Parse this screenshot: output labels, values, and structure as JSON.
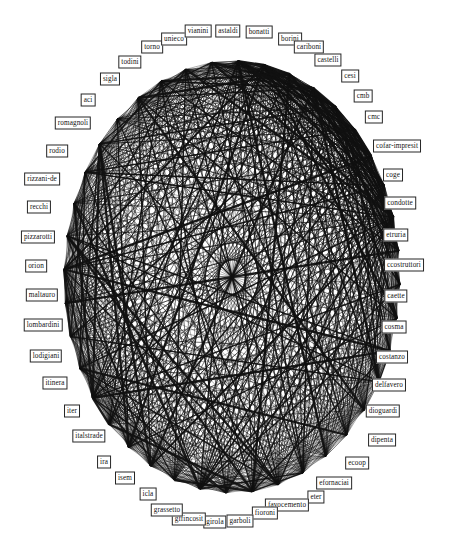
{
  "figure": {
    "title": "",
    "type": "network-graph",
    "layout": "circular-ellipse",
    "background_color": "#ffffff",
    "node_border_color": "#262626",
    "node_fill_color": "#ffffff",
    "edge_color": "#111111",
    "label_text_color": "#111111"
  },
  "chart_data": {
    "type": "network",
    "title": "",
    "xlabel": "",
    "ylabel": "",
    "grid": false,
    "legend": "none",
    "layout": "circular",
    "node_count": 40,
    "nodes": [
      {
        "id": "astaldi",
        "label": "astaldi",
        "x": 228,
        "y": 31,
        "angle": -88
      },
      {
        "id": "bonatti",
        "label": "bonatti",
        "x": 259,
        "y": 32,
        "angle": -79
      },
      {
        "id": "borini",
        "label": "borini",
        "x": 290,
        "y": 39,
        "angle": -70
      },
      {
        "id": "cariboni",
        "label": "cariboni",
        "x": 309,
        "y": 47,
        "angle": -61
      },
      {
        "id": "castelli",
        "label": "castelli",
        "x": 328,
        "y": 60,
        "angle": -52
      },
      {
        "id": "cesi",
        "label": "cesi",
        "x": 350,
        "y": 76,
        "angle": -43
      },
      {
        "id": "cmb",
        "label": "cmb",
        "x": 363,
        "y": 96,
        "angle": -34
      },
      {
        "id": "cmc",
        "label": "cmc",
        "x": 374,
        "y": 117,
        "angle": -25
      },
      {
        "id": "cofar-impresit",
        "label": "cofar-impresit",
        "x": 397,
        "y": 146,
        "angle": -16
      },
      {
        "id": "coge",
        "label": "coge",
        "x": 393,
        "y": 175,
        "angle": -7
      },
      {
        "id": "condotte",
        "label": "condotte",
        "x": 400,
        "y": 203,
        "angle": 2
      },
      {
        "id": "etruria",
        "label": "etruria",
        "x": 396,
        "y": 235,
        "angle": 11
      },
      {
        "id": "ccostruttori",
        "label": "ccostruttori",
        "x": 404,
        "y": 265,
        "angle": 20
      },
      {
        "id": "caette",
        "label": "caette",
        "x": 396,
        "y": 296,
        "angle": 29
      },
      {
        "id": "cosma",
        "label": "cosma",
        "x": 394,
        "y": 327,
        "angle": 38
      },
      {
        "id": "costanzo",
        "label": "costanzo",
        "x": 392,
        "y": 357,
        "angle": 47
      },
      {
        "id": "delfavero",
        "label": "delfavero",
        "x": 389,
        "y": 385,
        "angle": 56
      },
      {
        "id": "dioguardi",
        "label": "dioguardi",
        "x": 383,
        "y": 411,
        "angle": 65
      },
      {
        "id": "dipenta",
        "label": "dipenta",
        "x": 382,
        "y": 440,
        "angle": 74
      },
      {
        "id": "ecoop",
        "label": "ecoop",
        "x": 357,
        "y": 463,
        "angle": 83
      },
      {
        "id": "efornaciai",
        "label": "efornaciai",
        "x": 334,
        "y": 483,
        "angle": 92
      },
      {
        "id": "eter",
        "label": "eter",
        "x": 316,
        "y": 497,
        "angle": 101
      },
      {
        "id": "favocemento",
        "label": "favocemento",
        "x": 287,
        "y": 505,
        "angle": 110
      },
      {
        "id": "fioroni",
        "label": "fioroni",
        "x": 265,
        "y": 513,
        "angle": 119
      },
      {
        "id": "garboli",
        "label": "garboli",
        "x": 240,
        "y": 521,
        "angle": 128
      },
      {
        "id": "girola",
        "label": "girola",
        "x": 215,
        "y": 522,
        "angle": 137
      },
      {
        "id": "gffincosit",
        "label": "gffincosit",
        "x": 189,
        "y": 519,
        "angle": 146
      },
      {
        "id": "grassetto",
        "label": "grassetto",
        "x": 167,
        "y": 510,
        "angle": 155
      },
      {
        "id": "icla",
        "label": "icla",
        "x": 148,
        "y": 494,
        "angle": 164
      },
      {
        "id": "isem",
        "label": "isem",
        "x": 125,
        "y": 478,
        "angle": 173
      },
      {
        "id": "ira",
        "label": "ira",
        "x": 104,
        "y": 462,
        "angle": 182
      },
      {
        "id": "italstrade",
        "label": "italstrade",
        "x": 89,
        "y": 436,
        "angle": 191
      },
      {
        "id": "iter",
        "label": "iter",
        "x": 72,
        "y": 411,
        "angle": 200
      },
      {
        "id": "itinera",
        "label": "itinera",
        "x": 55,
        "y": 383,
        "angle": 209
      },
      {
        "id": "lodigiani",
        "label": "lodigiani",
        "x": 46,
        "y": 356,
        "angle": 218
      },
      {
        "id": "lombardini",
        "label": "lombardini",
        "x": 43,
        "y": 325,
        "angle": 227
      },
      {
        "id": "maltauro",
        "label": "maltauro",
        "x": 42,
        "y": 295,
        "angle": 236
      },
      {
        "id": "orion",
        "label": "orion",
        "x": 36,
        "y": 266,
        "angle": 245
      },
      {
        "id": "pizzarotti",
        "label": "pizzarotti",
        "x": 38,
        "y": 237,
        "angle": 254
      },
      {
        "id": "recchi",
        "label": "recchi",
        "x": 39,
        "y": 207,
        "angle": 263
      },
      {
        "id": "rizzani-de",
        "label": "rizzani-de",
        "x": 42,
        "y": 179,
        "angle": 272
      },
      {
        "id": "rodio",
        "label": "rodio",
        "x": 57,
        "y": 151,
        "angle": 281
      },
      {
        "id": "romagnoli",
        "label": "romagnoli",
        "x": 73,
        "y": 123,
        "angle": 290
      },
      {
        "id": "aci",
        "label": "aci",
        "x": 88,
        "y": 100,
        "angle": 299
      },
      {
        "id": "sigla",
        "label": "sigla",
        "x": 110,
        "y": 79,
        "angle": 308
      },
      {
        "id": "todini",
        "label": "todini",
        "x": 130,
        "y": 62,
        "angle": 317
      },
      {
        "id": "torno",
        "label": "torno",
        "x": 152,
        "y": 47,
        "angle": 326
      },
      {
        "id": "unieco",
        "label": "unieco",
        "x": 174,
        "y": 39,
        "angle": 335
      },
      {
        "id": "vianini",
        "label": "vianini",
        "x": 198,
        "y": 31,
        "angle": 344
      }
    ],
    "edge_density": "very-high",
    "edges_note": "near-complete graph: most node pairs connected by straight chords of varying stroke weight"
  }
}
